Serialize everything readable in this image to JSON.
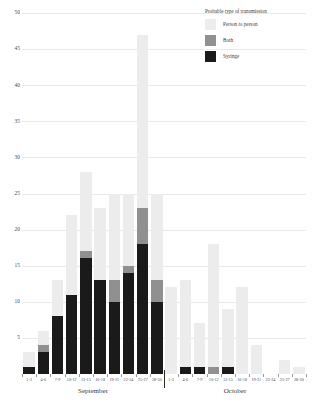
{
  "chart_data": {
    "type": "bar",
    "title": "",
    "subtitle": "",
    "xlabel": "",
    "ylabel": "",
    "ylim": [
      0,
      50
    ],
    "ytick_step": 5,
    "yticks": [
      "0",
      "5",
      "10",
      "15",
      "20",
      "25",
      "30",
      "35",
      "40",
      "45",
      "50"
    ],
    "grid": true,
    "stacked": true,
    "legend_position": "top-right",
    "legend_title": "Probable type of transmission",
    "categories": [
      "1-3",
      "4-6",
      "7-9",
      "10-12",
      "13-15",
      "16-18",
      "19-21",
      "22-24",
      "25-27",
      "28-30",
      "1-3",
      "4-6",
      "7-9",
      "10-12",
      "13-15",
      "16-18",
      "19-21",
      "22-24",
      "25-27",
      "28-30"
    ],
    "groups": [
      {
        "name": "September",
        "start": 0,
        "count": 10
      },
      {
        "name": "October",
        "start": 10,
        "count": 10
      }
    ],
    "series": [
      {
        "name": "Syringe",
        "color": "#1a1a1a",
        "values": [
          1,
          3,
          8,
          11,
          16,
          13,
          10,
          14,
          18,
          10,
          0,
          1,
          1,
          0,
          1,
          0,
          0,
          0,
          0,
          0
        ]
      },
      {
        "name": "Both",
        "color": "#909090",
        "values": [
          0,
          1,
          0,
          0,
          1,
          0,
          3,
          1,
          5,
          3,
          0,
          0,
          0,
          1,
          0,
          0,
          0,
          0,
          0,
          0
        ]
      },
      {
        "name": "Person to person",
        "color": "#ececec",
        "values": [
          2,
          2,
          5,
          11,
          11,
          10,
          12,
          10,
          24,
          12,
          12,
          12,
          6,
          17,
          8,
          12,
          4,
          0,
          2,
          1
        ]
      }
    ],
    "totals": [
      3,
      6,
      13,
      22,
      28,
      23,
      25,
      25,
      47,
      25,
      12,
      13,
      7,
      18,
      9,
      12,
      4,
      0,
      2,
      1
    ]
  }
}
